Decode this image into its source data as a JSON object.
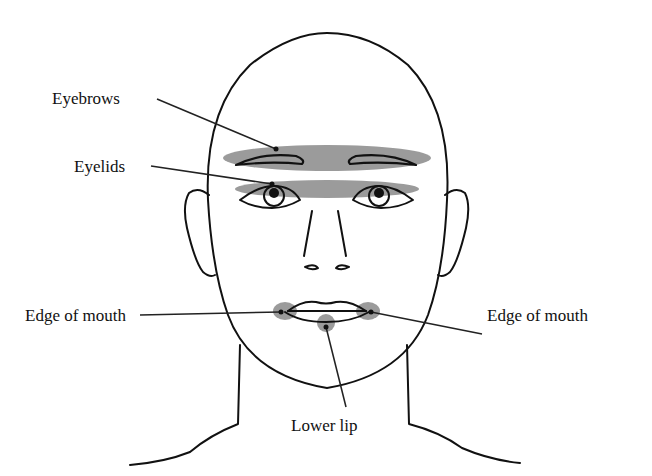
{
  "diagram": {
    "highlight_color": "#8a8a8a",
    "line_color": "#111111",
    "labels": [
      {
        "id": "eyebrows",
        "text": "Eyebrows",
        "x": 52,
        "y": 92,
        "point": [
          276,
          149
        ]
      },
      {
        "id": "eyelids",
        "text": "Eyelids",
        "x": 74,
        "y": 160,
        "point": [
          272,
          184
        ]
      },
      {
        "id": "edge-of-mouth-left",
        "text": "Edge of mouth",
        "x": 25,
        "y": 307,
        "point": [
          281,
          312
        ]
      },
      {
        "id": "edge-of-mouth-right",
        "text": "Edge of mouth",
        "x": 487,
        "y": 307,
        "point": [
          371,
          312
        ]
      },
      {
        "id": "lower-lip",
        "text": "Lower lip",
        "x": 291,
        "y": 415,
        "point": [
          326,
          327
        ]
      }
    ],
    "highlighted_regions": [
      "Eyebrows",
      "Eyelids",
      "Edge of mouth (left)",
      "Edge of mouth (right)",
      "Lower lip"
    ]
  }
}
